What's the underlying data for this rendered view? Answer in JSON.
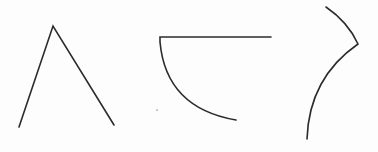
{
  "diagram": {
    "background": "#fdfdfd",
    "stroke_color": "#2b2b2b",
    "stroke_width": 1.6,
    "shapes": [
      {
        "name": "peak-shape",
        "type": "polyline",
        "points": "19,127 53,26 114,125"
      },
      {
        "name": "quarter-arc-shape",
        "type": "path",
        "d": "M271,37 L160,37 L160,42 Q166,108 236,120"
      },
      {
        "name": "hook-curve-shape",
        "type": "path",
        "d": "M326,7 Q348,22 358,44 Q309,78 307,139"
      }
    ],
    "marks": [
      {
        "name": "stray-dot",
        "cx": 157,
        "cy": 110,
        "r": 0.8
      }
    ]
  }
}
